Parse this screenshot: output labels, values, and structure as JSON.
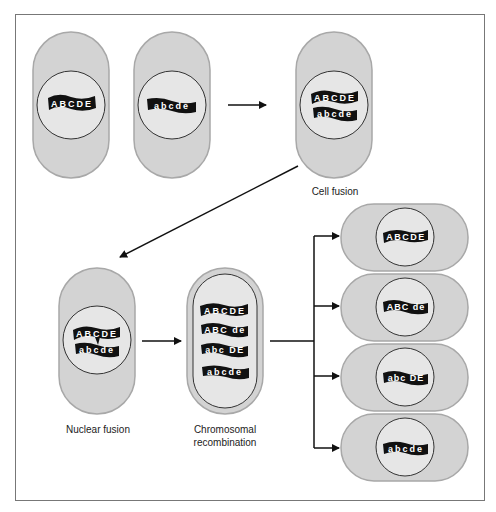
{
  "colors": {
    "cell_fill": "#d3d3d3",
    "cell_stroke": "#9a9a9a",
    "nucleus_fill": "#e6e6e6",
    "nucleus_stroke": "#333333",
    "chromosome_fill": "#111111",
    "chromosome_text": "#ffffff",
    "frame": "#666666",
    "arrow": "#111111"
  },
  "labels": {
    "cell_fusion": "Cell fusion",
    "nuclear_fusion": "Nuclear fusion",
    "chromosomal_recombination_line1": "Chromosomal",
    "chromosomal_recombination_line2": "recombination"
  },
  "cells": {
    "parent_1": {
      "chromosomes": [
        "ABCDE"
      ]
    },
    "parent_2": {
      "chromosomes": [
        "abcde"
      ]
    },
    "cell_fusion": {
      "chromosomes": [
        "ABCDE",
        "abcde"
      ]
    },
    "nuclear_fusion": {
      "chromosomes": [
        "ABCDE",
        "abcde"
      ]
    },
    "recombination": {
      "chromosomes": [
        "ABCDE",
        "ABC de",
        "abc DE",
        "abcde"
      ]
    },
    "progeny": [
      {
        "chromosome": "ABCDE"
      },
      {
        "chromosome": "ABC de"
      },
      {
        "chromosome": "abc DE"
      },
      {
        "chromosome": "abcde"
      }
    ]
  }
}
